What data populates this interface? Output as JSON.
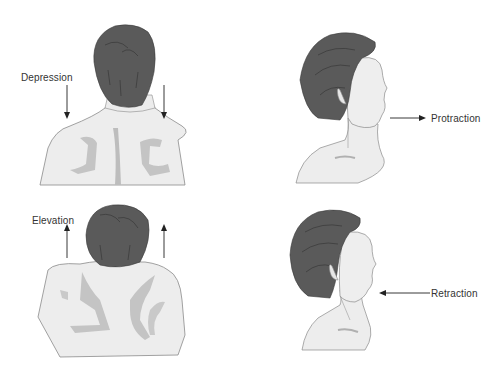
{
  "figure": {
    "panels": [
      {
        "id": "depression",
        "label": "Depression",
        "arrow_direction": "down",
        "view": "posterior torso"
      },
      {
        "id": "elevation",
        "label": "Elevation",
        "arrow_direction": "up",
        "view": "posterior torso"
      },
      {
        "id": "protraction",
        "label": "Protraction",
        "arrow_direction": "right",
        "view": "lateral head"
      },
      {
        "id": "retraction",
        "label": "Retraction",
        "arrow_direction": "left",
        "view": "lateral head"
      }
    ],
    "colors": {
      "hair": "#5a5a5a",
      "hair_stroke": "#3a3a3a",
      "skin": "#ededed",
      "skin_stroke": "#8a8a8a",
      "shadow": "#b8b8b8",
      "arrow": "#222222",
      "text": "#333333"
    }
  }
}
